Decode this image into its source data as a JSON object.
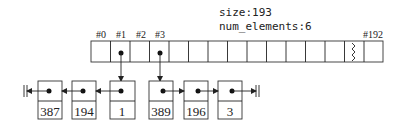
{
  "info": {
    "size_label": "size:193",
    "num_elements_label": "num_elements:6"
  },
  "array": {
    "cell_count": 15,
    "index_labels": [
      {
        "label": "#0",
        "cell": 0
      },
      {
        "label": "#1",
        "cell": 1
      },
      {
        "label": "#2",
        "cell": 2
      },
      {
        "label": "#3",
        "cell": 3
      },
      {
        "label": "#192",
        "cell": 14
      }
    ],
    "pointer_cells": [
      1,
      3
    ],
    "break_cell": 13
  },
  "chains": [
    {
      "from_index": "#1",
      "direction": "left",
      "values": [
        "1",
        "194",
        "387"
      ]
    },
    {
      "from_index": "#3",
      "direction": "right",
      "values": [
        "389",
        "196",
        "3"
      ]
    }
  ],
  "nodes": [
    {
      "value": "387"
    },
    {
      "value": "194"
    },
    {
      "value": "1"
    },
    {
      "value": "389"
    },
    {
      "value": "196"
    },
    {
      "value": "3"
    }
  ]
}
